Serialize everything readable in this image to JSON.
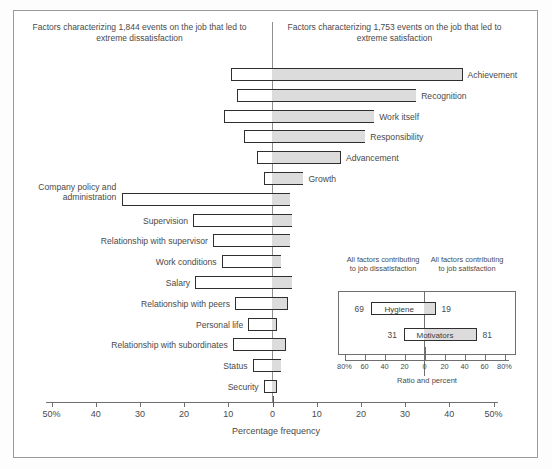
{
  "figure": {
    "header_left": "Factors characterizing 1,844 events on the job that led to extreme dissatisfaction",
    "header_right": "Factors characterizing 1,753 events on the job that led to extreme satisfaction",
    "axis_title": "Percentage frequency"
  },
  "chart_data": {
    "type": "bar",
    "xlabel": "Percentage frequency",
    "ylabel": "",
    "xlim": [
      -50,
      50
    ],
    "grid": false,
    "legend": "none",
    "orientation": "horizontal-diverging",
    "axis_ticks": [
      "50%",
      "40",
      "30",
      "20",
      "10",
      "0",
      "10",
      "20",
      "30",
      "40",
      "50%"
    ],
    "axis_tick_values": [
      -50,
      -40,
      -30,
      -20,
      -10,
      0,
      10,
      20,
      30,
      40,
      50
    ],
    "categories": [
      "Achievement",
      "Recognition",
      "Work itself",
      "Responsibility",
      "Advancement",
      "Growth",
      "Company policy and administration",
      "Supervision",
      "Relationship with supervisor",
      "Work conditions",
      "Salary",
      "Relationship with peers",
      "Personal life",
      "Relationship with subordinates",
      "Status",
      "Security"
    ],
    "series": [
      {
        "name": "Factors leading to extreme dissatisfaction",
        "values": [
          -9.5,
          -8,
          -11,
          -6.5,
          -3.5,
          -2,
          -34,
          -18,
          -13.5,
          -11.5,
          -17.5,
          -8.5,
          -5.5,
          -9,
          -4.5,
          -2
        ]
      },
      {
        "name": "Factors leading to extreme satisfaction",
        "values": [
          43,
          32.5,
          23,
          21,
          15.5,
          7,
          4,
          4.5,
          4,
          2,
          4.5,
          3.5,
          1,
          3,
          2,
          1
        ]
      }
    ]
  },
  "bars": [
    {
      "label": "Achievement",
      "label_side": "right",
      "left": -9.5,
      "right": 43
    },
    {
      "label": "Recognition",
      "label_side": "right",
      "left": -8,
      "right": 32.5
    },
    {
      "label": "Work itself",
      "label_side": "right",
      "left": -11,
      "right": 23
    },
    {
      "label": "Responsibility",
      "label_side": "right",
      "left": -6.5,
      "right": 21
    },
    {
      "label": "Advancement",
      "label_side": "right",
      "left": -3.5,
      "right": 15.5
    },
    {
      "label": "Growth",
      "label_side": "right",
      "left": -2,
      "right": 7
    },
    {
      "label": "Company policy and administration",
      "label_side": "left-multi",
      "left": -34,
      "right": 4
    },
    {
      "label": "Supervision",
      "label_side": "left",
      "left": -18,
      "right": 4.5
    },
    {
      "label": "Relationship with supervisor",
      "label_side": "left",
      "left": -13.5,
      "right": 4
    },
    {
      "label": "Work conditions",
      "label_side": "left",
      "left": -11.5,
      "right": 2
    },
    {
      "label": "Salary",
      "label_side": "left",
      "left": -17.5,
      "right": 4.5
    },
    {
      "label": "Relationship with peers",
      "label_side": "left",
      "left": -8.5,
      "right": 3.5
    },
    {
      "label": "Personal life",
      "label_side": "left",
      "left": -5.5,
      "right": 1
    },
    {
      "label": "Relationship with subordinates",
      "label_side": "left",
      "left": -9,
      "right": 3
    },
    {
      "label": "Status",
      "label_side": "left",
      "left": -4.5,
      "right": 2
    },
    {
      "label": "Security",
      "label_side": "left",
      "left": -2,
      "right": 1
    }
  ],
  "inset": {
    "header_left": "All factors contributing to job dissatisfaction",
    "header_right": "All factors contributing to job satisfaction",
    "axis_title": "Ratio and percent",
    "axis_ticks": [
      "80%",
      "60",
      "40",
      "20",
      "0",
      "20",
      "40",
      "60",
      "80%"
    ],
    "axis_tick_values": [
      -80,
      -60,
      -40,
      -20,
      0,
      20,
      40,
      60,
      80
    ],
    "chart_data": {
      "type": "bar",
      "orientation": "horizontal-diverging",
      "xlim": [
        -80,
        80
      ],
      "xlabel": "Ratio and percent",
      "categories": [
        "Hygiene",
        "Motivators"
      ],
      "series": [
        {
          "name": "Contributing to job dissatisfaction",
          "values": [
            69,
            31
          ]
        },
        {
          "name": "Contributing to job satisfaction",
          "values": [
            19,
            81
          ]
        }
      ]
    },
    "bars": [
      {
        "label": "Hygiene",
        "left_value": "69",
        "right_value": "19",
        "left": -54,
        "right": 11
      },
      {
        "label": "Motivators",
        "left_value": "31",
        "right_value": "81",
        "left": -21,
        "right": 52
      }
    ]
  }
}
